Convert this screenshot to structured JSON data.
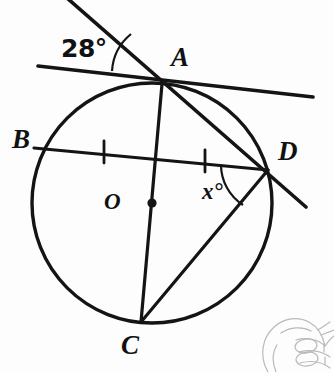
{
  "figure": {
    "background_color": "#fdfdfd",
    "stroke_color": "#141414",
    "sketch_color": "#b9b9b9"
  },
  "labels": {
    "point_a": "A",
    "point_b": "B",
    "point_c": "C",
    "point_d": "D",
    "center_o": "O",
    "angle_tangent": "28°",
    "angle_unknown": "x°"
  },
  "geometry": {
    "circle": {
      "cx": 152,
      "cy": 203,
      "r": 120
    },
    "points": {
      "A": {
        "x": 162,
        "y": 84
      },
      "B": {
        "x": 34,
        "y": 148
      },
      "C": {
        "x": 141,
        "y": 322
      },
      "D": {
        "x": 268,
        "y": 170
      },
      "O": {
        "x": 152,
        "y": 203
      }
    },
    "tangent_line": {
      "x1": 38,
      "y1": 66,
      "x2": 313,
      "y2": 97
    },
    "secant_line": {
      "x1": 67,
      "y1": -2,
      "x2": 306,
      "y2": 207
    },
    "chord_bd": {
      "x1": 34,
      "y1": 148,
      "x2": 268,
      "y2": 170
    },
    "diameter_ac": {
      "x1": 162,
      "y1": 84,
      "x2": 141,
      "y2": 322
    },
    "chord_dc": {
      "x1": 268,
      "y1": 170,
      "x2": 141,
      "y2": 322
    },
    "tick_marks": [
      {
        "x": 104,
        "y": 152
      },
      {
        "x": 205,
        "y": 161
      }
    ],
    "center_dot": {
      "x": 152,
      "y": 203,
      "r": 4.5
    }
  },
  "annotations": {
    "angle_28_position": {
      "x": 61,
      "y": 36
    },
    "angle_x_position": {
      "x": 202,
      "y": 180
    },
    "label_a_position": {
      "x": 171,
      "y": 44
    },
    "label_b_position": {
      "x": 12,
      "y": 126
    },
    "label_c_position": {
      "x": 121,
      "y": 332
    },
    "label_d_position": {
      "x": 278,
      "y": 138
    },
    "label_o_position": {
      "x": 104,
      "y": 190
    }
  }
}
